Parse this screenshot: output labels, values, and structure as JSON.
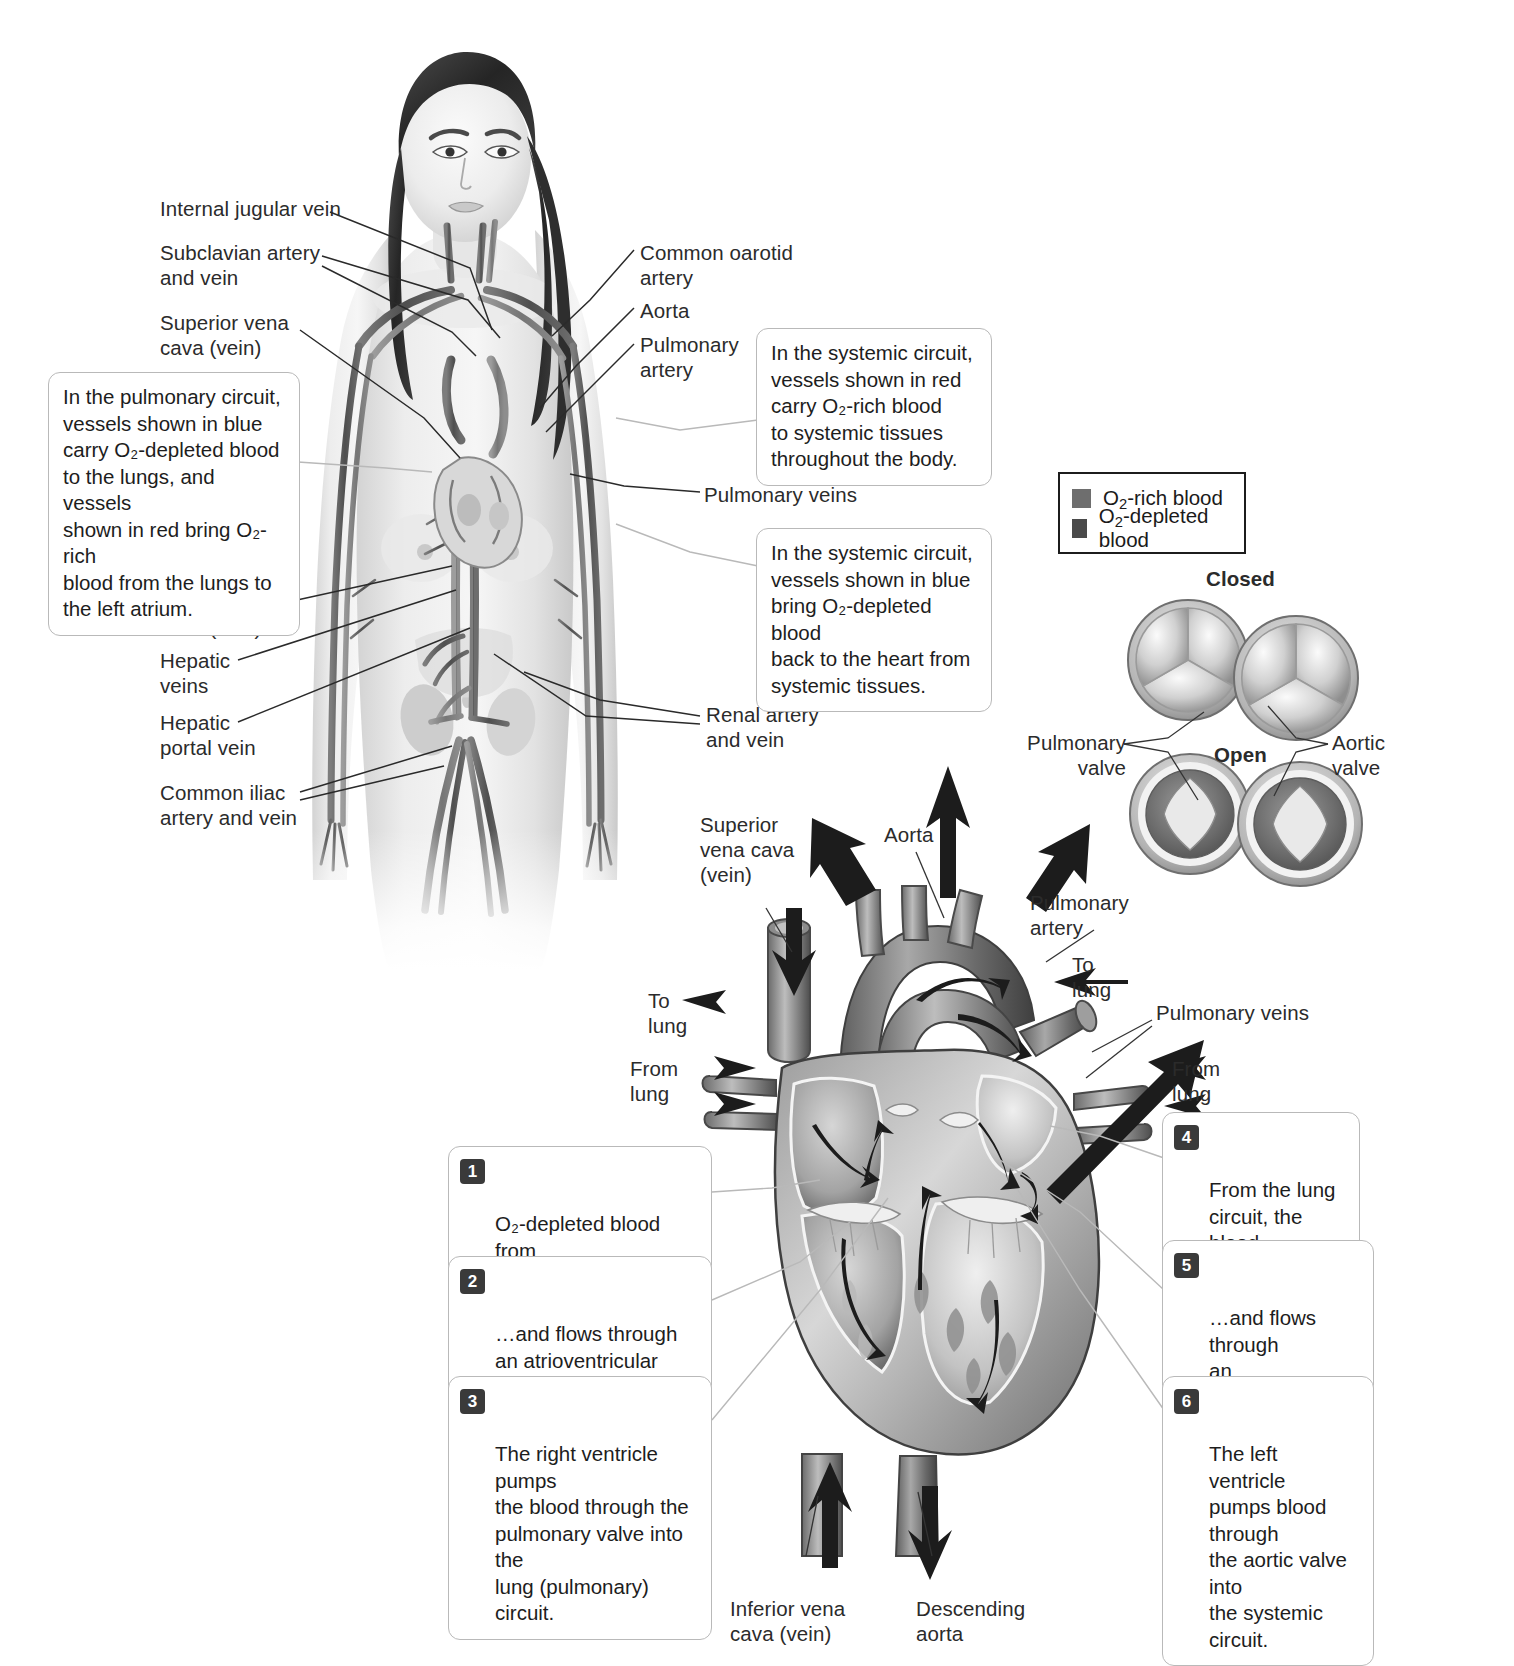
{
  "figure": {
    "body_labels": [
      {
        "id": "internal-jugular-vein",
        "text": "Internal jugular vein"
      },
      {
        "id": "subclavian",
        "text": "Subclavian artery\nand vein"
      },
      {
        "id": "superior-vena-cava",
        "text": "Superior vena\ncava (vein)"
      },
      {
        "id": "inferior-vena-cava",
        "text": "Inferior vena\ncava (vein)"
      },
      {
        "id": "hepatic-veins",
        "text": "Hepatic\nveins"
      },
      {
        "id": "hepatic-portal-vein",
        "text": "Hepatic\nportal vein"
      },
      {
        "id": "common-iliac",
        "text": "Common iliac\nartery and vein"
      },
      {
        "id": "common-carotid-artery",
        "text": "Common oarotid\nartery"
      },
      {
        "id": "aorta",
        "text": "Aorta"
      },
      {
        "id": "pulmonary-artery",
        "text": "Pulmonary\nartery"
      },
      {
        "id": "pulmonary-veins",
        "text": "Pulmonary veins"
      },
      {
        "id": "renal",
        "text": "Renal artery\nand vein"
      }
    ],
    "circuit_callouts": [
      {
        "id": "pulmonary-circuit",
        "text": "In the pulmonary circuit,\nvessels shown in blue\ncarry O₂-depleted blood\nto the lungs, and vessels\nshown in red bring O₂-rich\nblood from the lungs to\nthe left atrium."
      },
      {
        "id": "systemic-red",
        "text": "In the systemic circuit,\nvessels shown in red\ncarry O₂-rich blood\nto systemic tissues\nthroughout the body."
      },
      {
        "id": "systemic-blue",
        "text": "In the systemic circuit,\nvessels shown in blue\nbring O₂-depleted blood\nback to the heart from\nsystemic tissues."
      }
    ],
    "legend": {
      "items": [
        {
          "label_prefix": "O",
          "label_sub": "2",
          "label_suffix": "-rich blood",
          "color": "#6e6e6e"
        },
        {
          "label_prefix": "O",
          "label_sub": "2",
          "label_suffix": "-depleted blood",
          "color": "#4a4a4a"
        }
      ]
    },
    "valve_detail": {
      "closed_label": "Closed",
      "open_label": "Open",
      "pulmonary_label": "Pulmonary\nvalve",
      "aortic_label": "Aortic\nvalve"
    },
    "heart_labels": [
      {
        "id": "heart-superior-vena-cava",
        "text": "Superior\nvena cava\n(vein)"
      },
      {
        "id": "heart-aorta",
        "text": "Aorta"
      },
      {
        "id": "heart-pulmonary-artery",
        "text": "Pulmonary\nartery"
      },
      {
        "id": "heart-to-lung-left",
        "text": "To\nlung"
      },
      {
        "id": "heart-to-lung-right",
        "text": "To\nlung"
      },
      {
        "id": "heart-from-lung-left",
        "text": "From\nlung"
      },
      {
        "id": "heart-from-lung-right",
        "text": "From\nlung"
      },
      {
        "id": "heart-pulmonary-veins",
        "text": "Pulmonary veins"
      },
      {
        "id": "heart-inferior-vena-cava",
        "text": "Inferior vena\ncava (vein)"
      },
      {
        "id": "heart-descending-aorta",
        "text": "Descending\naorta"
      }
    ],
    "flow_steps": [
      {
        "num": "1",
        "text": "O₂-depleted blood from\nthe systemic tissues\nenters the right atrium…"
      },
      {
        "num": "2",
        "text": "…and flows through\nan atrioventricular valve\ninto  the right ventricle."
      },
      {
        "num": "3",
        "text": "The right ventricle pumps\nthe blood through the\npulmonary valve into the\nlung (pulmonary) circuit."
      },
      {
        "num": "4",
        "text": "From the lung\ncircuit, the blood\nreturns to the\nleft atrium…"
      },
      {
        "num": "5",
        "text": "…and flows through\nan atrioventricular\nvalve into the left\nventricle."
      },
      {
        "num": "6",
        "text": "The left ventricle\npumps blood through\nthe aortic valve into\nthe systemic circuit."
      }
    ]
  }
}
